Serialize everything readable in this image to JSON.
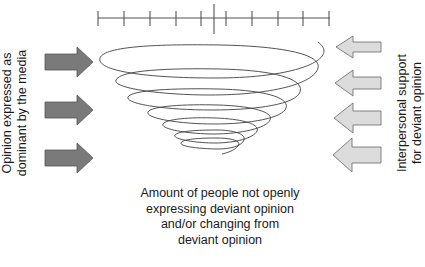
{
  "diagram": {
    "scale": {
      "tick_count": 11,
      "center_marker": true
    },
    "left_label": {
      "lines": [
        "Opinion expressed as",
        "dominant by the media"
      ]
    },
    "right_label": {
      "lines": [
        "Interpersonal support",
        "for deviant opinion"
      ]
    },
    "bottom_caption": {
      "lines": [
        "Amount of people not openly",
        "expressing deviant opinion",
        "and/or changing from",
        "deviant opinion"
      ]
    },
    "left_arrows": {
      "count": 3,
      "direction": "right",
      "fill": "#7a7a7a",
      "stroke": "#555555"
    },
    "right_arrows": {
      "count": 4,
      "direction": "left",
      "fill": "#dcdcdc",
      "stroke": "#666666"
    },
    "spiral": {
      "turns": 7,
      "stroke": "#444444",
      "shape": "funnel narrowing downward"
    }
  }
}
